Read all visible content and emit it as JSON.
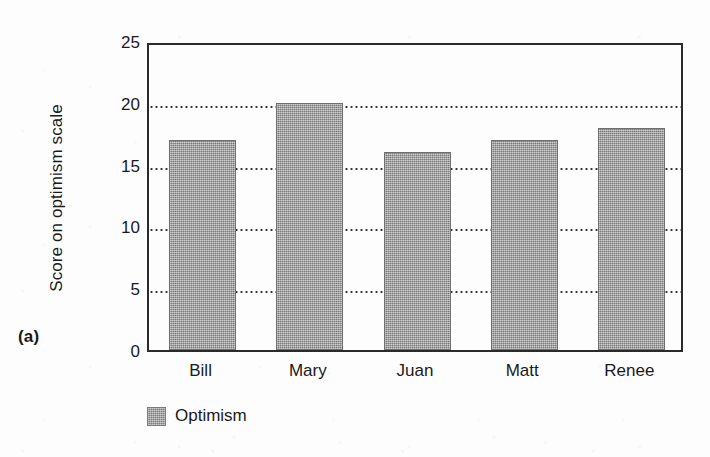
{
  "panel": {
    "label": "(a)"
  },
  "legend": {
    "position": "below-axis",
    "swatch_color": "#9c9c9c",
    "entries": [
      {
        "label": "Optimism",
        "color": "#9c9c9c"
      }
    ]
  },
  "colors": {
    "bar_fill": "#9c9c9c",
    "bar_edge": "#6f6f6f",
    "axis": "#2b2b2b",
    "gridline": "#333333",
    "background": "#fdfdfd",
    "text": "#1a1a1a"
  },
  "chart_data": {
    "type": "bar",
    "title": "",
    "xlabel": "",
    "ylabel": "Score on optimism scale",
    "categories": [
      "Bill",
      "Mary",
      "Juan",
      "Matt",
      "Renee"
    ],
    "values": [
      17,
      20,
      16,
      17,
      18
    ],
    "series": [
      {
        "name": "Optimism",
        "values": [
          17,
          20,
          16,
          17,
          18
        ]
      }
    ],
    "ylim": [
      0,
      25
    ],
    "yticks": [
      0,
      5,
      10,
      15,
      20,
      25
    ],
    "ytick_labels": [
      "0",
      "5",
      "10",
      "15",
      "20",
      "25"
    ],
    "gridlines": {
      "horizontal": true,
      "style": "dotted",
      "at": [
        5,
        10,
        15,
        20
      ]
    },
    "legend_position": "bottom-left"
  }
}
